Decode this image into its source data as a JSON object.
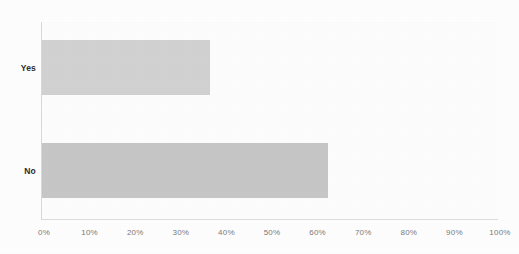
{
  "chart_data": {
    "type": "bar",
    "orientation": "horizontal",
    "title": "",
    "subtitle": "",
    "xlabel": "",
    "ylabel": "",
    "categories": [
      "Yes",
      "No"
    ],
    "values": [
      37,
      63
    ],
    "value_suffix": "%",
    "series": [
      {
        "name": "",
        "values": [
          37,
          63
        ]
      }
    ],
    "xlim": [
      0,
      100
    ],
    "x_tick_labels": [
      "0%",
      "10%",
      "20%",
      "30%",
      "40%",
      "50%",
      "60%",
      "70%",
      "80%",
      "90%",
      "100%"
    ],
    "x_tick_values": [
      0,
      10,
      20,
      30,
      40,
      50,
      60,
      70,
      80,
      90,
      100
    ],
    "y_tick_labels": [
      "Yes",
      "No"
    ],
    "grid": false,
    "legend": false,
    "legend_position": "none",
    "annotations": [],
    "colors": {
      "bar_yes": "#d1d1d1",
      "bar_no": "#c6c6c6",
      "axis_line": "#d8d8d8",
      "tick_label": "#7a7a7a",
      "category_label": "#2b2b2b",
      "plot_background": "#fcfcfc",
      "figure_background": "#fdfdfd"
    }
  }
}
